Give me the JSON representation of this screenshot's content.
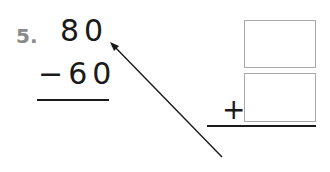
{
  "problem": {
    "number": "5.",
    "minuend": "80",
    "subtrahend": "−60",
    "answer_operator": "+",
    "answer_boxes": [
      "",
      ""
    ]
  },
  "colors": {
    "ink": "#1a1a1a",
    "number_label": "#8a8a8a",
    "box_border": "#a8a8a8"
  }
}
